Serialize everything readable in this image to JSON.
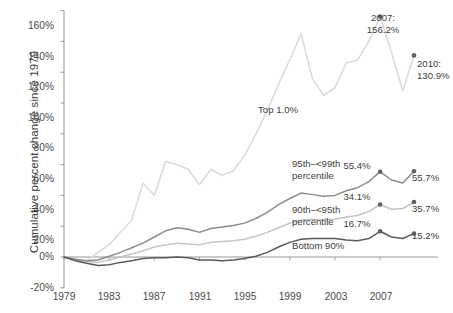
{
  "chart_data": {
    "type": "line",
    "title": "",
    "xlabel": "",
    "ylabel": "Cumulative percent change since 1979",
    "xlim": [
      1979,
      2010
    ],
    "ylim": [
      -20,
      160
    ],
    "grid": false,
    "legend": "inline-annotations",
    "ytick_labels": [
      "160%",
      "140%",
      "120%",
      "100%",
      "80%",
      "60%",
      "40%",
      "20%",
      "0%",
      "-20%"
    ],
    "ytick_values": [
      160,
      140,
      120,
      100,
      80,
      60,
      40,
      20,
      0,
      -20
    ],
    "xtick_labels": [
      "1979",
      "1983",
      "1987",
      "1991",
      "1995",
      "1999",
      "2003",
      "2007"
    ],
    "xtick_values": [
      1979,
      1983,
      1987,
      1991,
      1995,
      1999,
      2003,
      2007
    ],
    "x": [
      1979,
      1980,
      1981,
      1982,
      1983,
      1984,
      1985,
      1986,
      1987,
      1988,
      1989,
      1990,
      1991,
      1992,
      1993,
      1994,
      1995,
      1996,
      1997,
      1998,
      1999,
      2000,
      2001,
      2002,
      2003,
      2004,
      2005,
      2006,
      2007,
      2008,
      2009,
      2010
    ],
    "series": [
      {
        "name": "Top 1.0%",
        "color": "#d9d9d9",
        "label": "Top 1.0%",
        "values": [
          0,
          -2.0,
          -2.5,
          3.0,
          8.0,
          16.0,
          24.0,
          48.0,
          40.0,
          62.0,
          60.0,
          57.0,
          47.0,
          57.0,
          53.0,
          56.0,
          66.0,
          80.0,
          95.0,
          112.0,
          128.0,
          145.0,
          116.0,
          105.0,
          110.0,
          126.0,
          128.0,
          140.0,
          156.2,
          133.0,
          108.0,
          130.9
        ],
        "endpoint_label": "130.9%",
        "endpoint_value": 130.9,
        "peak_label": "156.2%",
        "peak_year": 2007,
        "peak_value": 156.2
      },
      {
        "name": "95th–<99th percentile",
        "color": "#8c8c8c",
        "label": "95th–<99th\npercentile",
        "values": [
          0,
          -1.5,
          -2.5,
          -2.0,
          0.5,
          3.0,
          6.0,
          9.0,
          13.0,
          17.0,
          19.0,
          18.0,
          16.0,
          18.5,
          19.5,
          20.5,
          22.0,
          25.0,
          29.0,
          34.0,
          38.0,
          41.5,
          40.5,
          39.5,
          40.0,
          43.0,
          45.0,
          49.0,
          55.4,
          50.0,
          48.0,
          55.7
        ],
        "endpoint_label": "55.7%",
        "endpoint_value": 55.7,
        "peak_label": "55.4%",
        "peak_year": 2007,
        "peak_value": 55.4
      },
      {
        "name": "90th–<95th percentile",
        "color": "#c4c4c4",
        "label": "90th–<95th\npercentile",
        "values": [
          0,
          -1.5,
          -3.0,
          -3.5,
          -2.0,
          0.0,
          2.0,
          4.0,
          6.5,
          8.0,
          9.0,
          8.5,
          8.0,
          9.5,
          10.0,
          10.5,
          11.5,
          13.5,
          16.0,
          19.0,
          22.0,
          24.0,
          24.5,
          24.0,
          24.5,
          26.0,
          27.0,
          29.5,
          34.1,
          31.0,
          31.5,
          35.7
        ],
        "endpoint_label": "35.7%",
        "endpoint_value": 35.7,
        "peak_label": "34.1%",
        "peak_year": 2007,
        "peak_value": 34.1
      },
      {
        "name": "Bottom 90%",
        "color": "#5a5a5a",
        "label": "Bottom 90%",
        "values": [
          0,
          -2.5,
          -4.0,
          -5.5,
          -5.0,
          -3.5,
          -2.5,
          -1.0,
          -0.5,
          -0.5,
          0.0,
          -0.5,
          -2.0,
          -2.0,
          -2.5,
          -2.0,
          -1.0,
          0.5,
          3.0,
          6.5,
          9.5,
          11.5,
          12.0,
          12.0,
          12.0,
          11.0,
          10.5,
          12.0,
          16.7,
          13.0,
          12.0,
          15.2
        ],
        "endpoint_label": "15.2%",
        "endpoint_value": 15.2,
        "peak_label": "16.7%",
        "peak_year": 2007,
        "peak_value": 16.7
      }
    ],
    "annotations": [
      {
        "text": "2007:\n156.2%",
        "series": "Top 1.0%"
      },
      {
        "text": "2010:\n130.9%",
        "series": "Top 1.0%"
      }
    ]
  }
}
